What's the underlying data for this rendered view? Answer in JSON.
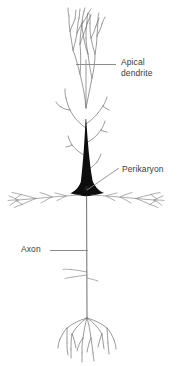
{
  "figure": {
    "background_color": "#ffffff",
    "ink_color": "#5a5a5a",
    "soma_color": "#0d0d0d",
    "text_color": "#3b3b3b",
    "leader_color": "#8c8c8c",
    "width": 178,
    "height": 366
  },
  "labels": {
    "apical_dendrite": {
      "line1": "Apical",
      "line2": "dendrite",
      "leader": "horizontal",
      "text_x": 121,
      "text_y": 57
    },
    "perikaryon": {
      "text": "Perikaryon",
      "leader": "diagonal",
      "text_x": 122,
      "text_y": 164
    },
    "axon": {
      "text": "Axon",
      "leader": "horizontal",
      "text_x": 21,
      "text_y": 244
    }
  },
  "structures": {
    "apical_dendrite_label": "apical-dendrite",
    "apical_tuft_label": "apical-tuft-branches",
    "oblique_branches_label": "oblique-dendrite-branches",
    "perikaryon_label": "perikaryon-soma",
    "basal_left_label": "basal-dendrite-left",
    "basal_right_label": "basal-dendrite-right",
    "axon_label": "axon",
    "axon_collateral_label": "axon-collateral",
    "axon_terminal_label": "axon-terminal-arbor"
  }
}
